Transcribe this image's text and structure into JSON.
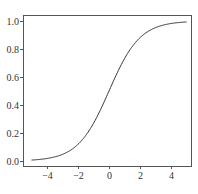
{
  "chart_data": {
    "type": "line",
    "title": "",
    "xlabel": "",
    "ylabel": "",
    "function": "sigmoid: y = 1 / (1 + exp(-x))",
    "xlim": [
      -5.3,
      5.3
    ],
    "ylim": [
      -0.05,
      1.03
    ],
    "grid": false,
    "legend": null,
    "x_ticks": [
      -4,
      -2,
      0,
      2,
      4
    ],
    "x_tick_labels": [
      "−4",
      "−2",
      "0",
      "2",
      "4"
    ],
    "y_ticks": [
      0.0,
      0.2,
      0.4,
      0.6,
      0.8,
      1.0
    ],
    "y_tick_labels": [
      "0.0",
      "0.2",
      "0.4",
      "0.6",
      "0.8",
      "1.0"
    ],
    "series": [
      {
        "name": "sigmoid",
        "color": "#333333",
        "x": [
          -5,
          -4,
          -3,
          -2,
          -1,
          0,
          1,
          2,
          3,
          4,
          5
        ],
        "y": [
          0.007,
          0.018,
          0.047,
          0.119,
          0.269,
          0.5,
          0.731,
          0.881,
          0.953,
          0.982,
          0.993
        ]
      }
    ]
  },
  "colors": {
    "line": "#333333",
    "axes": "#555555",
    "text": "#333333",
    "background": "#ffffff"
  }
}
